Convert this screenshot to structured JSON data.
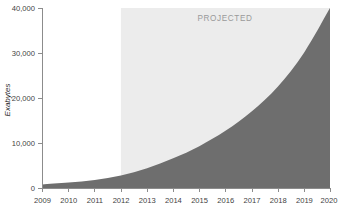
{
  "chart_data": {
    "type": "area",
    "title": "",
    "subtitle": "",
    "xlabel": "",
    "ylabel": "Exabytes",
    "x": [
      2009,
      2010,
      2011,
      2012,
      2013,
      2014,
      2015,
      2016,
      2017,
      2018,
      2019,
      2020
    ],
    "categories": [
      "2009",
      "2010",
      "2011",
      "2012",
      "2013",
      "2014",
      "2015",
      "2016",
      "2017",
      "2018",
      "2019",
      "2020"
    ],
    "values": [
      800,
      1200,
      1800,
      2800,
      4400,
      6600,
      9300,
      12700,
      17000,
      22500,
      30000,
      40000
    ],
    "series": [
      {
        "name": "Data volume",
        "values": [
          800,
          1200,
          1800,
          2800,
          4400,
          6600,
          9300,
          12700,
          17000,
          22500,
          30000,
          40000
        ]
      }
    ],
    "xlim": [
      2009,
      2020
    ],
    "ylim": [
      0,
      40000
    ],
    "ytick_values": [
      0,
      10000,
      20000,
      30000,
      40000
    ],
    "ytick_labels": [
      "0",
      "10,000",
      "20,000",
      "30,000",
      "40,000"
    ],
    "xtick_labels": [
      "2009",
      "2010",
      "2011",
      "2012",
      "2013",
      "2014",
      "2015",
      "2016",
      "2017",
      "2018",
      "2019",
      "2020"
    ],
    "grid": false,
    "legend": "none",
    "annotations": [
      {
        "text": "PROJECTED",
        "x_start": 2012,
        "x_end": 2020,
        "note": "Light shaded band covering projected years"
      }
    ],
    "colors": {
      "area_fill": "#6e6e6e",
      "projected_band": "#ececec",
      "axis": "#8c8c8c",
      "tick_text": "#3f3f3f",
      "axis_title": "#2e2e2e",
      "projected_text": "#9a9a9a",
      "background": "#ffffff"
    }
  },
  "labels": {
    "y_axis_title": "Exabytes",
    "projected_band_text": "PROJECTED",
    "y_0": "0",
    "y_10k": "10,000",
    "y_20k": "20,000",
    "y_30k": "30,000",
    "y_40k": "40,000",
    "x_2009": "2009",
    "x_2010": "2010",
    "x_2011": "2011",
    "x_2012": "2012",
    "x_2013": "2013",
    "x_2014": "2014",
    "x_2015": "2015",
    "x_2016": "2016",
    "x_2017": "2017",
    "x_2018": "2018",
    "x_2019": "2019",
    "x_2020": "2020"
  }
}
